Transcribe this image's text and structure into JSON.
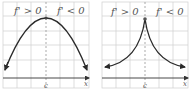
{
  "panels": [
    {
      "id": "left",
      "shape": "smooth-maximum",
      "left_label": "f' > 0",
      "right_label": "f' < 0",
      "critical_point_label": "c",
      "x_axis_label": "x"
    },
    {
      "id": "right",
      "shape": "cusp-maximum",
      "left_label": "f' > 0",
      "right_label": "f' < 0",
      "critical_point_label": "c",
      "x_axis_label": "x"
    }
  ],
  "colors": {
    "grid": "#c8c8c8",
    "curve": "#2a2a2a",
    "axis": "#333333",
    "dashed": "#888888",
    "text": "#555555"
  }
}
